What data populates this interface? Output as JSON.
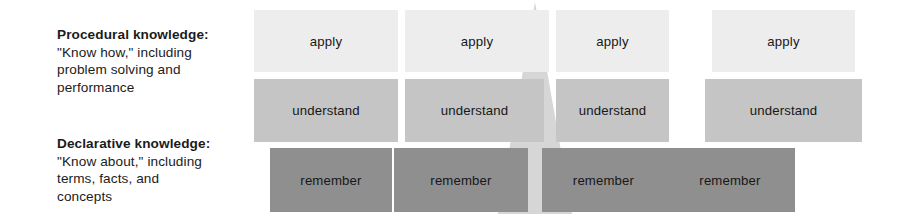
{
  "legend": {
    "procedural": {
      "title": "Procedural knowledge:",
      "line1": "\"Know how,\" including",
      "line2": "problem solving and",
      "line3": "performance"
    },
    "declarative": {
      "title": "Declarative knowledge:",
      "line1": "\"Know about,\" including",
      "line2": "terms, facts, and",
      "line3": "concepts"
    }
  },
  "matrix": {
    "rows": [
      {
        "name": "apply",
        "label": "apply",
        "color": "#ededed",
        "cells": [
          "apply",
          "apply",
          "apply",
          "apply"
        ]
      },
      {
        "name": "understand",
        "label": "understand",
        "color": "#c5c5c5",
        "cells": [
          "understand",
          "understand",
          "understand",
          "understand"
        ]
      },
      {
        "name": "remember",
        "label": "remember",
        "color": "#8f8f8f",
        "cells": [
          "remember",
          "remember",
          "remember",
          "remember"
        ]
      }
    ],
    "column_count": 4
  },
  "overlay": {
    "shape": "triangle-up",
    "color": "#d6d6d6"
  }
}
